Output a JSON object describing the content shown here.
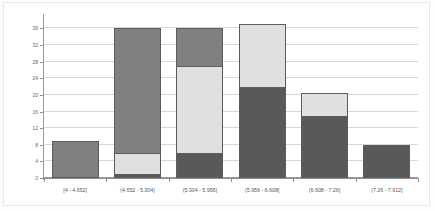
{
  "chart_data": {
    "type": "bar",
    "subtype": "stacked-histogram",
    "title": "",
    "xlabel": "",
    "ylabel": "",
    "ylim": [
      0,
      39
    ],
    "grid": true,
    "legend": "none",
    "y_ticks": [
      0,
      4,
      8,
      12,
      16,
      20,
      24,
      28,
      32,
      36
    ],
    "y_tick_labels": [
      "0",
      "4",
      "8",
      "12",
      "16",
      "20",
      "24",
      "28",
      "32",
      "36"
    ],
    "categories": [
      "[4 - 4.652]",
      "(4.652 - 5.304]",
      "(5.304 - 5.956]",
      "(5.956 - 6.608]",
      "(6.608 - 7.26]",
      "(7.26 - 7.912]"
    ],
    "series": [
      {
        "name": "dark",
        "color": "#595959",
        "values": [
          0,
          1,
          6,
          22,
          15,
          8
        ]
      },
      {
        "name": "light",
        "color": "#e0e0e0",
        "values": [
          0,
          5,
          21,
          15,
          5.5,
          0
        ]
      },
      {
        "name": "medium",
        "color": "#808080",
        "values": [
          9,
          30,
          9,
          0,
          0,
          0
        ]
      }
    ],
    "totals": [
      9,
      36,
      36,
      37,
      20.5,
      8
    ],
    "colors": {
      "dark": "#595959",
      "light": "#e0e0e0",
      "medium": "#808080",
      "gridline": "#d8d8d8",
      "axis": "#8f8f8f",
      "bar_outline": "#5d5d5d",
      "background": "#ffffff",
      "tick_text": "#6c6c6c"
    }
  }
}
